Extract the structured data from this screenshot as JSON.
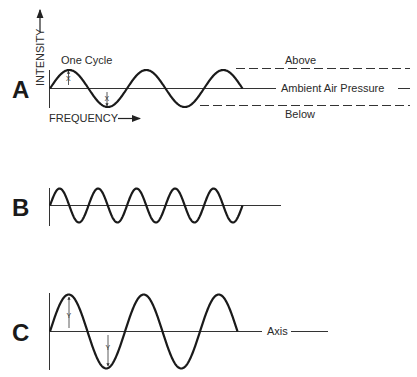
{
  "panels": [
    {
      "letter": "A",
      "y_axis_label": "INTENSITY",
      "x_axis_label": "FREQUENCY",
      "cycle_label": "One Cycle",
      "amplitude_marker": "X",
      "cycles": 2.5,
      "relative_amplitude": 1,
      "relative_frequency": 1,
      "pressure_labels": {
        "above": "Above",
        "ambient": "Ambient Air Pressure",
        "below": "Below"
      }
    },
    {
      "letter": "B",
      "cycles": 5,
      "relative_amplitude": 1,
      "relative_frequency": 2
    },
    {
      "letter": "C",
      "amplitude_marker": "Y",
      "axis_label": "Axis",
      "cycles": 2.5,
      "relative_amplitude": 2,
      "relative_frequency": 1
    }
  ]
}
